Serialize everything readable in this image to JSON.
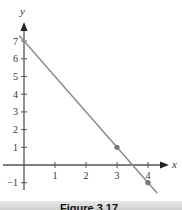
{
  "chart_data": {
    "type": "line",
    "title": "",
    "xlabel": "x",
    "ylabel": "y",
    "x_ticks": [
      "1",
      "2",
      "3",
      "4"
    ],
    "y_ticks": [
      "-1",
      "1",
      "2",
      "3",
      "4",
      "5",
      "6",
      "7"
    ],
    "xlim": [
      -0.7,
      4.9
    ],
    "ylim": [
      -1.6,
      7.8
    ],
    "series": [
      {
        "name": "line",
        "x": [
          -0.15,
          4.3
        ],
        "y": [
          7.3,
          -1.6
        ]
      }
    ],
    "points": [
      {
        "x": 3,
        "y": 1
      },
      {
        "x": 4,
        "y": -1
      }
    ],
    "colors": {
      "line": "#888888",
      "axis": "#555555",
      "point": "#777777"
    },
    "grid": false
  },
  "labels": {
    "x_axis": "x",
    "y_axis": "y",
    "caption": "Figure 3.17"
  }
}
